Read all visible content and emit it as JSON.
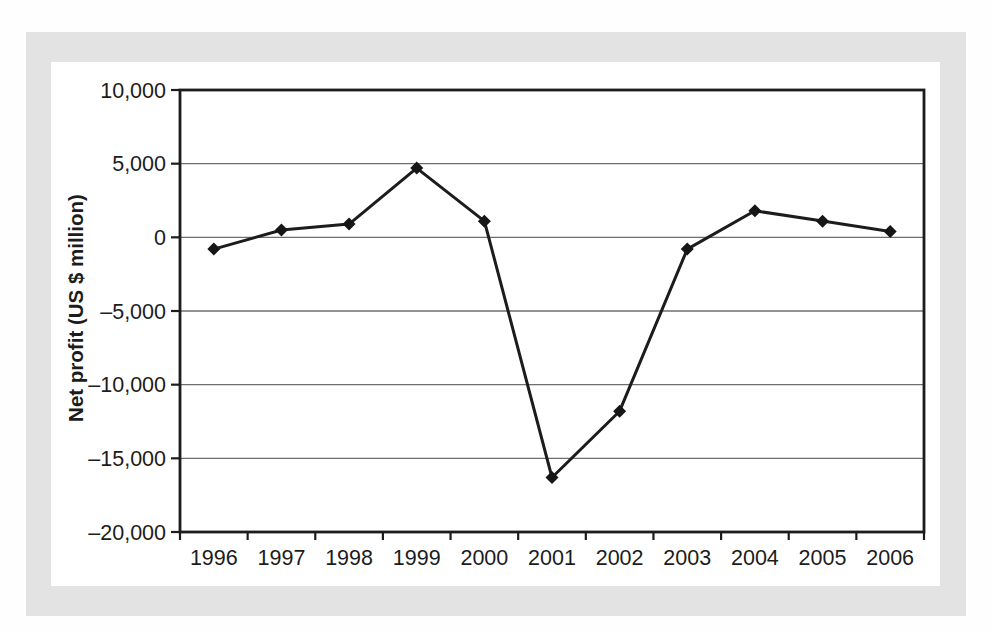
{
  "figure": {
    "page_background": "#fefefe",
    "frame_color": "#e3e3e3",
    "panel_color": "#ffffff"
  },
  "chart_data": {
    "type": "line",
    "title": "",
    "xlabel": "",
    "ylabel": "Net profit (US $ million)",
    "categories": [
      "1996",
      "1997",
      "1998",
      "1999",
      "2000",
      "2001",
      "2002",
      "2003",
      "2004",
      "2005",
      "2006"
    ],
    "series": [
      {
        "name": "Net profit",
        "values": [
          -800,
          500,
          900,
          4700,
          1100,
          -16300,
          -11800,
          -800,
          1800,
          1100,
          400
        ]
      }
    ],
    "ylim": [
      -20000,
      10000
    ],
    "ytick_interval": 5000,
    "ytick_values": [
      10000,
      5000,
      0,
      -5000,
      -10000,
      -15000,
      -20000
    ],
    "ytick_labels": [
      "10,000",
      "5,000",
      "0",
      "–10,000 placeholder unused",
      "",
      "",
      ""
    ],
    "ytick_labels_display": [
      "10,000",
      "5,000",
      "0",
      "–5,000",
      "–10,000",
      "–15,000",
      "–20,000"
    ],
    "grid": "horizontal",
    "legend": "none",
    "marker": "diamond",
    "line_color": "#1c1c1c",
    "marker_color": "#161616",
    "gridline_color": "#6e6e6e",
    "border_color": "#1c1c1c",
    "text_color": "#1c1c1c"
  }
}
